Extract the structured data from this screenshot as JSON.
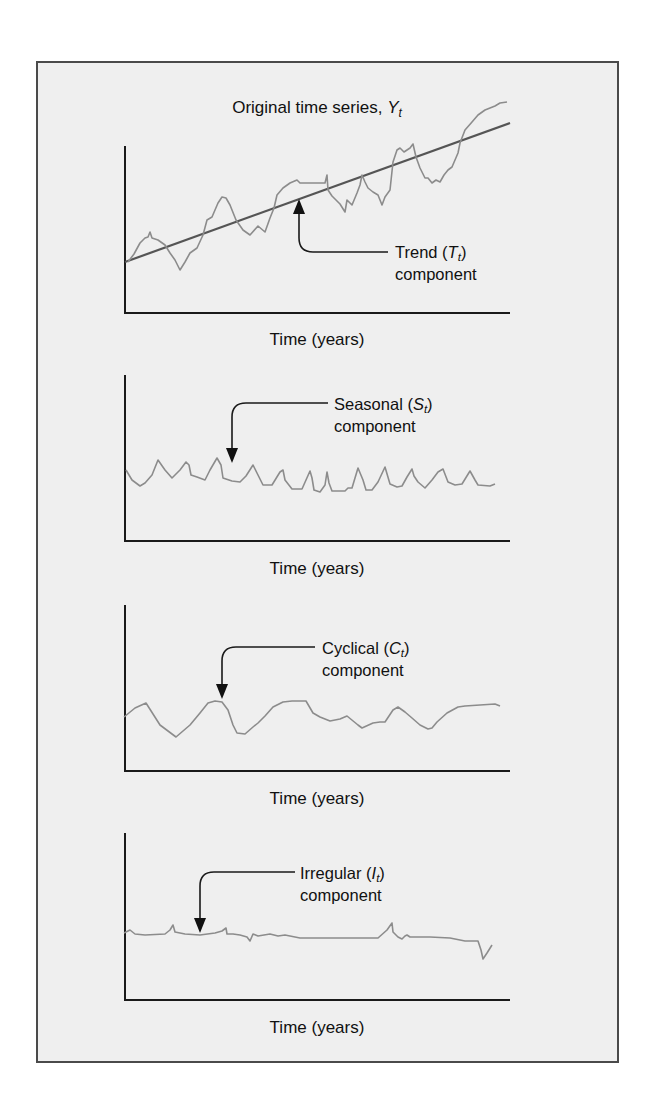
{
  "figure": {
    "background": "#efefef",
    "frame_color": "#4a4a4a",
    "series_color": "#8c8c8c",
    "trend_color": "#555555"
  },
  "chart_data": [
    {
      "type": "line",
      "id": "original",
      "title": "Original time series, ",
      "title_symbol": "Y",
      "title_subscript": "t",
      "xlabel": "Time (years)",
      "ylabel": "",
      "annotation": {
        "text": "Trend (",
        "symbol": "T",
        "subscript": "t",
        "close": ")",
        "line2": "component"
      },
      "series": [
        {
          "name": "Y_t (original)",
          "points": [
            [
              128,
              262
            ],
            [
              134,
              254
            ],
            [
              140,
              243
            ],
            [
              145,
              238
            ],
            [
              148,
              237
            ],
            [
              150,
              232
            ],
            [
              152,
              238
            ],
            [
              158,
              240
            ],
            [
              165,
              245
            ],
            [
              170,
              253
            ],
            [
              175,
              260
            ],
            [
              180,
              270
            ],
            [
              185,
              262
            ],
            [
              190,
              253
            ],
            [
              197,
              248
            ],
            [
              203,
              235
            ],
            [
              207,
              220
            ],
            [
              212,
              217
            ],
            [
              218,
              203
            ],
            [
              222,
              197
            ],
            [
              226,
              198
            ],
            [
              230,
              205
            ],
            [
              236,
              220
            ],
            [
              243,
              230
            ],
            [
              250,
              235
            ],
            [
              258,
              226
            ],
            [
              265,
              232
            ],
            [
              270,
              218
            ],
            [
              274,
              208
            ],
            [
              277,
              195
            ],
            [
              283,
              188
            ],
            [
              290,
              183
            ],
            [
              297,
              180
            ],
            [
              300,
              183
            ],
            [
              325,
              183
            ],
            [
              327,
              175
            ],
            [
              328,
              190
            ],
            [
              332,
              196
            ],
            [
              340,
              204
            ],
            [
              345,
              212
            ],
            [
              347,
              200
            ],
            [
              352,
              205
            ],
            [
              357,
              193
            ],
            [
              360,
              185
            ],
            [
              362,
              175
            ],
            [
              365,
              182
            ],
            [
              368,
              188
            ],
            [
              373,
              192
            ],
            [
              378,
              195
            ],
            [
              382,
              205
            ],
            [
              385,
              197
            ],
            [
              390,
              190
            ],
            [
              393,
              162
            ],
            [
              397,
              150
            ],
            [
              400,
              148
            ],
            [
              404,
              152
            ],
            [
              410,
              148
            ],
            [
              413,
              144
            ],
            [
              416,
              157
            ],
            [
              420,
              168
            ],
            [
              425,
              178
            ],
            [
              428,
              178
            ],
            [
              432,
              183
            ],
            [
              436,
              180
            ],
            [
              440,
              182
            ],
            [
              444,
              175
            ],
            [
              448,
              170
            ],
            [
              452,
              167
            ],
            [
              455,
              160
            ],
            [
              458,
              153
            ],
            [
              460,
              143
            ],
            [
              465,
              130
            ],
            [
              472,
              122
            ],
            [
              478,
              115
            ],
            [
              485,
              110
            ],
            [
              490,
              108
            ],
            [
              495,
              106
            ],
            [
              500,
              103
            ],
            [
              507,
              102
            ]
          ]
        },
        {
          "name": "T_t (trend)",
          "points": [
            [
              125,
              262
            ],
            [
              510,
              123
            ]
          ]
        }
      ]
    },
    {
      "type": "line",
      "id": "seasonal",
      "xlabel": "Time (years)",
      "annotation": {
        "text": "Seasonal (",
        "symbol": "S",
        "subscript": "t",
        "close": ")",
        "line2": "component"
      },
      "series": [
        {
          "name": "S_t (seasonal)",
          "points": [
            [
              126,
              470
            ],
            [
              132,
              480
            ],
            [
              140,
              486
            ],
            [
              145,
              483
            ],
            [
              152,
              475
            ],
            [
              158,
              460
            ],
            [
              165,
              470
            ],
            [
              172,
              478
            ],
            [
              180,
              470
            ],
            [
              186,
              462
            ],
            [
              189,
              465
            ],
            [
              191,
              475
            ],
            [
              197,
              477
            ],
            [
              205,
              480
            ],
            [
              210,
              470
            ],
            [
              217,
              458
            ],
            [
              221,
              465
            ],
            [
              223,
              478
            ],
            [
              232,
              481
            ],
            [
              240,
              482
            ],
            [
              246,
              476
            ],
            [
              253,
              465
            ],
            [
              258,
              475
            ],
            [
              263,
              485
            ],
            [
              272,
              485
            ],
            [
              280,
              472
            ],
            [
              283,
              470
            ],
            [
              285,
              480
            ],
            [
              292,
              489
            ],
            [
              302,
              489
            ],
            [
              306,
              480
            ],
            [
              310,
              471
            ],
            [
              312,
              478
            ],
            [
              314,
              490
            ],
            [
              320,
              492
            ],
            [
              325,
              485
            ],
            [
              327,
              472
            ],
            [
              329,
              483
            ],
            [
              332,
              491
            ],
            [
              345,
              491
            ],
            [
              348,
              488
            ],
            [
              352,
              488
            ],
            [
              358,
              468
            ],
            [
              363,
              480
            ],
            [
              366,
              490
            ],
            [
              372,
              490
            ],
            [
              378,
              482
            ],
            [
              385,
              467
            ],
            [
              390,
              484
            ],
            [
              397,
              487
            ],
            [
              402,
              486
            ],
            [
              407,
              477
            ],
            [
              412,
              469
            ],
            [
              414,
              476
            ],
            [
              418,
              482
            ],
            [
              425,
              488
            ],
            [
              432,
              480
            ],
            [
              438,
              472
            ],
            [
              443,
              469
            ],
            [
              448,
              482
            ],
            [
              455,
              485
            ],
            [
              462,
              484
            ],
            [
              470,
              471
            ],
            [
              475,
              480
            ],
            [
              478,
              485
            ],
            [
              490,
              486
            ],
            [
              495,
              484
            ]
          ]
        }
      ]
    },
    {
      "type": "line",
      "id": "cyclical",
      "xlabel": "Time (years)",
      "annotation": {
        "text": "Cyclical (",
        "symbol": "C",
        "subscript": "t",
        "close": ")",
        "line2": "component"
      },
      "series": [
        {
          "name": "C_t (cyclical)",
          "points": [
            [
              124,
              717
            ],
            [
              135,
              708
            ],
            [
              146,
              703
            ],
            [
              160,
              725
            ],
            [
              176,
              737
            ],
            [
              190,
              725
            ],
            [
              200,
              713
            ],
            [
              208,
              703
            ],
            [
              215,
              701
            ],
            [
              222,
              702
            ],
            [
              228,
              710
            ],
            [
              233,
              725
            ],
            [
              237,
              733
            ],
            [
              245,
              734
            ],
            [
              253,
              727
            ],
            [
              258,
              723
            ],
            [
              265,
              716
            ],
            [
              273,
              707
            ],
            [
              283,
              702
            ],
            [
              292,
              701
            ],
            [
              306,
              701
            ],
            [
              313,
              713
            ],
            [
              320,
              717
            ],
            [
              330,
              721
            ],
            [
              340,
              719
            ],
            [
              347,
              716
            ],
            [
              358,
              725
            ],
            [
              362,
              728
            ],
            [
              373,
              723
            ],
            [
              380,
              722
            ],
            [
              385,
              722
            ],
            [
              393,
              710
            ],
            [
              398,
              707
            ],
            [
              405,
              712
            ],
            [
              412,
              718
            ],
            [
              420,
              725
            ],
            [
              428,
              729
            ],
            [
              432,
              728
            ],
            [
              437,
              722
            ],
            [
              447,
              713
            ],
            [
              458,
              707
            ],
            [
              465,
              706
            ],
            [
              480,
              705
            ],
            [
              495,
              704
            ],
            [
              500,
              706
            ]
          ]
        }
      ]
    },
    {
      "type": "line",
      "id": "irregular",
      "xlabel": "Time (years)",
      "annotation": {
        "text": "Irregular (",
        "symbol": "I",
        "subscript": "t",
        "close": ")",
        "line2": "component"
      },
      "series": [
        {
          "name": "I_t (irregular)",
          "points": [
            [
              124,
              933
            ],
            [
              130,
              930
            ],
            [
              135,
              934
            ],
            [
              145,
              935
            ],
            [
              165,
              934
            ],
            [
              170,
              930
            ],
            [
              173,
              925
            ],
            [
              175,
              932
            ],
            [
              185,
              934
            ],
            [
              200,
              935
            ],
            [
              215,
              933
            ],
            [
              222,
              931
            ],
            [
              226,
              928
            ],
            [
              227,
              934
            ],
            [
              233,
              934
            ],
            [
              240,
              935
            ],
            [
              247,
              937
            ],
            [
              250,
              941
            ],
            [
              253,
              934
            ],
            [
              258,
              936
            ],
            [
              270,
              934
            ],
            [
              278,
              936
            ],
            [
              285,
              935
            ],
            [
              300,
              938
            ],
            [
              315,
              938
            ],
            [
              330,
              938
            ],
            [
              378,
              938
            ],
            [
              387,
              930
            ],
            [
              392,
              923
            ],
            [
              393,
              932
            ],
            [
              398,
              937
            ],
            [
              402,
              939
            ],
            [
              405,
              936
            ],
            [
              407,
              935
            ],
            [
              410,
              937
            ],
            [
              430,
              937
            ],
            [
              450,
              938
            ],
            [
              465,
              941
            ],
            [
              478,
              941
            ],
            [
              481,
              950
            ],
            [
              483,
              959
            ],
            [
              487,
              953
            ],
            [
              492,
              945
            ]
          ]
        }
      ]
    }
  ]
}
